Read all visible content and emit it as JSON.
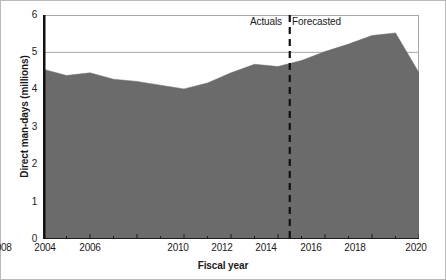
{
  "chart_data": {
    "type": "area",
    "title": "",
    "xlabel": "Fiscal year",
    "ylabel": "Direct man-days (millions)",
    "xlim": [
      2004,
      2020
    ],
    "ylim": [
      0,
      6
    ],
    "grid": "horizontal-light",
    "legend": "none",
    "series_name": "Direct man-days",
    "fill_color": "#6b6b6b",
    "x": [
      2004,
      2005,
      2006,
      2007,
      2008,
      2009,
      2010,
      2011,
      2012,
      2013,
      2014,
      2015,
      2016,
      2017,
      2018,
      2019,
      2020
    ],
    "values": [
      4.55,
      4.38,
      4.45,
      4.28,
      4.22,
      4.12,
      4.02,
      4.18,
      4.45,
      4.68,
      4.62,
      4.78,
      5.02,
      5.22,
      5.45,
      5.52,
      4.45
    ],
    "x_tick_labels": [
      "2004",
      "2006",
      "2008",
      "2010",
      "2012",
      "2014",
      "2016",
      "2018",
      "2020"
    ],
    "x_tick_values": [
      2004,
      2006,
      2008,
      2010,
      2012,
      2014,
      2016,
      2018,
      2020
    ],
    "x_minor_tick_values": [
      2005,
      2007,
      2009,
      2011,
      2013,
      2015,
      2017,
      2019
    ],
    "y_tick_labels": [
      "0",
      "1",
      "2",
      "3",
      "4",
      "5",
      "6"
    ],
    "y_tick_values": [
      0,
      1,
      2,
      3,
      4,
      5,
      6
    ],
    "gridline_values": [
      5,
      6
    ],
    "annotations": [
      {
        "name": "actuals",
        "text": "Actuals",
        "at_x": 2014.5,
        "side": "left"
      },
      {
        "name": "forecasted",
        "text": "Forecasted",
        "at_x": 2014.5,
        "side": "right"
      }
    ],
    "divider": {
      "x": 2014.5,
      "style": "dashed",
      "color": "#111111"
    }
  }
}
